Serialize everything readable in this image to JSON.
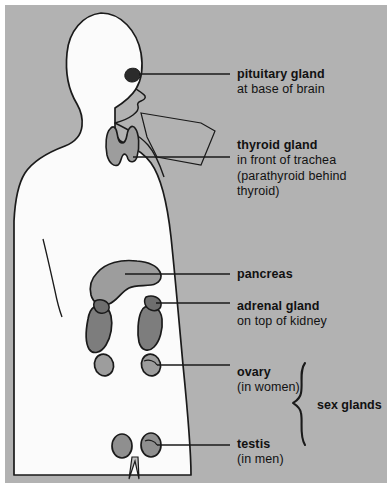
{
  "diagram": {
    "figure_name": "human-body-silhouette",
    "colors": {
      "background": "#b2b2b2",
      "page_margin": "#ffffff",
      "body_fill": "#fbfbfb",
      "outline": "#1a1a1a",
      "pancreas_fill": "#9d9d9d",
      "thyroid_fill": "#9d9d9d",
      "kidney_fill": "#7d7d7d",
      "adrenal_fill": "#6e6e6e",
      "ovary_fill": "#9d9d9d",
      "testis_fill": "#8f8f8f",
      "pituitary_fill": "#2b2b2b",
      "leader_line": "#1a1a1a",
      "text": "#111111"
    }
  },
  "labels": [
    {
      "id": "pituitary",
      "name": "pituitary gland",
      "detail": "at base of brain",
      "detail2": "",
      "detail3": ""
    },
    {
      "id": "thyroid",
      "name": "thyroid gland",
      "detail": "in front of trachea",
      "detail2": "(parathyroid behind",
      "detail3": "thyroid)"
    },
    {
      "id": "pancreas",
      "name": "pancreas",
      "detail": "",
      "detail2": "",
      "detail3": ""
    },
    {
      "id": "adrenal",
      "name": "adrenal gland",
      "detail": "on top of kidney",
      "detail2": "",
      "detail3": ""
    },
    {
      "id": "ovary",
      "name": "ovary",
      "detail": "(in women)",
      "detail2": "",
      "detail3": ""
    },
    {
      "id": "testis",
      "name": "testis",
      "detail": "(in men)",
      "detail2": "",
      "detail3": ""
    }
  ],
  "brace": {
    "label": "sex glands",
    "groups": [
      "ovary",
      "testis"
    ]
  },
  "organs": [
    {
      "id": "pituitary-gland",
      "label": "pituitary gland"
    },
    {
      "id": "thyroid-gland",
      "label": "thyroid gland"
    },
    {
      "id": "pancreas",
      "label": "pancreas"
    },
    {
      "id": "adrenal-gland-left",
      "label": "adrenal gland"
    },
    {
      "id": "adrenal-gland-right",
      "label": "adrenal gland"
    },
    {
      "id": "kidney-left",
      "label": "kidney"
    },
    {
      "id": "kidney-right",
      "label": "kidney"
    },
    {
      "id": "ovary-left",
      "label": "ovary"
    },
    {
      "id": "ovary-right",
      "label": "ovary"
    },
    {
      "id": "testis-left",
      "label": "testis"
    },
    {
      "id": "testis-right",
      "label": "testis"
    }
  ]
}
